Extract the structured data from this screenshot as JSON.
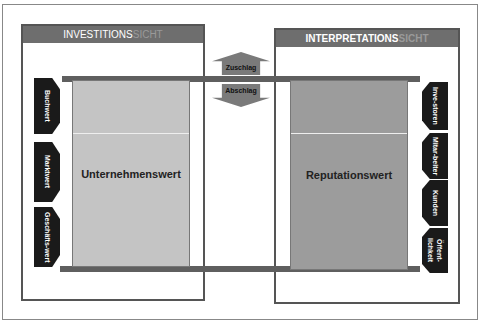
{
  "left_panel": {
    "title_main": "INVESTITIONS",
    "title_suffix": "SICHT",
    "value_box": "Unternehmenswert",
    "tags": [
      "Buchwert",
      "Marktwert",
      "Geschäfts-wert"
    ]
  },
  "right_panel": {
    "title_main": "INTERPRETATIONS",
    "title_suffix": "SICHT",
    "value_box": "Reputationswert",
    "tags": [
      "Inve-storen",
      "Mitar-beiter",
      "Kunden",
      "Öffent-lichkeit"
    ]
  },
  "arrows": {
    "up": "Zuschlag",
    "down": "Abschlag"
  },
  "colors": {
    "header": "#6e6e6e",
    "bar": "#5f5f5f",
    "left_box": "#c4c4c4",
    "right_box": "#9c9c9c",
    "tag": "#1a1a1a"
  }
}
